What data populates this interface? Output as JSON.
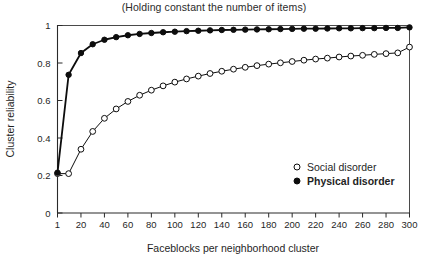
{
  "chart_data": {
    "type": "line",
    "title": "(Holding constant the number of items)",
    "xlabel": "Faceblocks per neighborhood cluster",
    "ylabel": "Cluster reliability",
    "xlim": [
      1,
      300
    ],
    "ylim": [
      0,
      1
    ],
    "grid": false,
    "legend_position": "inside-right",
    "xticks": [
      1,
      20,
      40,
      60,
      80,
      100,
      120,
      140,
      160,
      180,
      200,
      220,
      240,
      260,
      280,
      300
    ],
    "xticklabels": [
      "1",
      "20",
      "40",
      "60",
      "80",
      "100",
      "120",
      "140",
      "160",
      "180",
      "200",
      "220",
      "240",
      "260",
      "280",
      "300"
    ],
    "yticks": [
      0,
      0.2,
      0.4,
      0.6,
      0.8,
      1
    ],
    "yticklabels": [
      "0",
      "0.2",
      "0.4",
      "0.6",
      "0.8",
      "1"
    ],
    "x": [
      1,
      10,
      20,
      30,
      40,
      50,
      60,
      70,
      80,
      90,
      100,
      110,
      120,
      130,
      140,
      150,
      160,
      170,
      180,
      190,
      200,
      210,
      220,
      230,
      240,
      250,
      260,
      270,
      280,
      290,
      300
    ],
    "series": [
      {
        "name": "Social disorder",
        "marker": "open-circle",
        "marker_fill": "#ffffff",
        "marker_stroke": "#0d0d0d",
        "line_color": "#0d0d0d",
        "line_width": 1.0,
        "values": [
          0.21,
          0.21,
          0.34,
          0.435,
          0.505,
          0.555,
          0.595,
          0.628,
          0.655,
          0.678,
          0.698,
          0.715,
          0.73,
          0.744,
          0.756,
          0.767,
          0.777,
          0.786,
          0.794,
          0.801,
          0.808,
          0.815,
          0.821,
          0.826,
          0.832,
          0.837,
          0.841,
          0.846,
          0.85,
          0.854,
          0.885
        ]
      },
      {
        "name": "Physical disorder",
        "marker": "filled-circle",
        "marker_fill": "#0d0d0d",
        "marker_stroke": "#0d0d0d",
        "line_color": "#0d0d0d",
        "line_width": 1.8,
        "values": [
          0.215,
          0.737,
          0.853,
          0.9,
          0.924,
          0.938,
          0.948,
          0.955,
          0.96,
          0.964,
          0.967,
          0.97,
          0.972,
          0.974,
          0.976,
          0.977,
          0.978,
          0.979,
          0.98,
          0.981,
          0.982,
          0.983,
          0.983,
          0.984,
          0.985,
          0.985,
          0.986,
          0.986,
          0.987,
          0.987,
          0.99
        ]
      }
    ],
    "legend": [
      {
        "label": "Social disorder",
        "marker": "open-circle"
      },
      {
        "label": "Physical disorder",
        "marker": "filled-circle"
      }
    ]
  }
}
